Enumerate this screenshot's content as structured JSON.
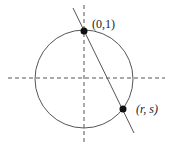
{
  "diagram": {
    "circle": {
      "cx": 85,
      "cy": 79,
      "r": 49,
      "stroke": "#555555"
    },
    "axes": {
      "stroke": "#555555",
      "dash": "4,3"
    },
    "line": {
      "x1": 73,
      "y1": 8,
      "x2": 134,
      "y2": 133,
      "stroke": "#555555"
    },
    "points": [
      {
        "label": "(0,1)",
        "x": 84,
        "y": 32
      },
      {
        "label": "(r, s)",
        "x": 123,
        "y": 109
      }
    ]
  }
}
